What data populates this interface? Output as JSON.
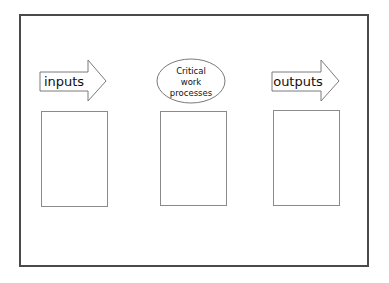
{
  "diagram": {
    "title": "",
    "stages": [
      {
        "id": "inputs",
        "shape": "arrow",
        "label": "inputs"
      },
      {
        "id": "process",
        "shape": "ellipse",
        "label_lines": [
          "Critical",
          "work",
          "processes"
        ]
      },
      {
        "id": "outputs",
        "shape": "arrow",
        "label": "outputs"
      }
    ],
    "boxes": [
      {
        "id": "inputs-box",
        "content": ""
      },
      {
        "id": "process-box",
        "content": ""
      },
      {
        "id": "outputs-box",
        "content": ""
      }
    ],
    "colors": {
      "frame": "#4a4a4a",
      "shape_stroke": "#7a7a7a",
      "text": "#111111",
      "background": "#ffffff"
    }
  }
}
